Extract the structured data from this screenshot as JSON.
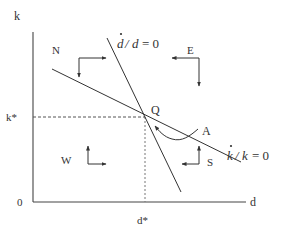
{
  "diagram": {
    "type": "phase_diagram",
    "axes": {
      "y_label": "k",
      "x_label": "d",
      "origin_label": "0",
      "y_equilibrium_label": "k*",
      "x_equilibrium_label": "d*"
    },
    "curves": {
      "d_nullcline": {
        "label_num": "d",
        "label_den": "d",
        "label_rhs": "= 0",
        "has_dot": true
      },
      "k_nullcline": {
        "label_num": "k",
        "label_den": "k",
        "label_rhs": "= 0",
        "has_dot": true
      },
      "trajectory": {
        "label": "A"
      }
    },
    "points": {
      "equilibrium": {
        "label": "Q"
      }
    },
    "regions": [
      {
        "label": "N",
        "arrows": [
          "right",
          "down"
        ]
      },
      {
        "label": "E",
        "arrows": [
          "left",
          "down"
        ]
      },
      {
        "label": "W",
        "arrows": [
          "up",
          "right"
        ]
      },
      {
        "label": "S",
        "arrows": [
          "up",
          "left"
        ]
      }
    ],
    "colors": {
      "line": "#333333",
      "dashed": "#555555",
      "background": "#ffffff"
    }
  }
}
